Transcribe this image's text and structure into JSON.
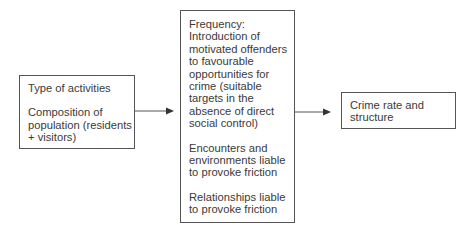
{
  "diagram": {
    "nodes": [
      {
        "id": "inputs",
        "paragraphs": [
          "Type of activities",
          "Composition of population (residents + visitors)"
        ],
        "lines": [
          [
            "Type of activities"
          ],
          [
            "Composition of",
            "population (residents",
            "+ visitors)"
          ]
        ]
      },
      {
        "id": "mechanisms",
        "paragraphs": [
          "Frequency: Introduction of motivated offenders to favourable opportunities for crime (suitable targets in the absence of direct social control)",
          "Encounters and environments liable to provoke friction",
          "Relationships liable to provoke friction"
        ],
        "lines": [
          [
            "Frequency:",
            "Introduction of",
            "motivated offenders",
            "to favourable",
            "opportunities for",
            "crime (suitable",
            "targets in the",
            "absence of direct",
            "social control)"
          ],
          [
            "Encounters and",
            "environments liable",
            "to provoke friction"
          ],
          [
            "Relationships liable",
            "to provoke friction"
          ]
        ]
      },
      {
        "id": "outcome",
        "paragraphs": [
          "Crime rate and structure"
        ],
        "lines": [
          [
            "Crime rate and",
            "structure"
          ]
        ]
      }
    ],
    "edges": [
      {
        "from": "inputs",
        "to": "mechanisms"
      },
      {
        "from": "mechanisms",
        "to": "outcome"
      }
    ],
    "colors": {
      "line": "#555555",
      "text": "#3a3a3a",
      "background": "#ffffff"
    }
  }
}
